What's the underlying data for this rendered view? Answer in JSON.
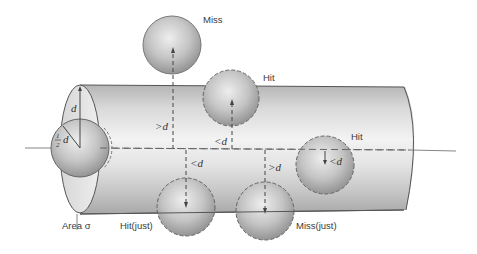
{
  "diagram": {
    "type": "collision-cross-section",
    "labels": {
      "miss": "Miss",
      "hit_top": "Hit",
      "hit_right": "Hit",
      "hit_just": "Hit(just)",
      "miss_just": "Miss(just)",
      "area": "Area σ",
      "d_vertical": "d",
      "half": "1",
      "half_den": "2",
      "half_d": "d",
      "gt_d_left": ">d",
      "lt_d_top": "<d",
      "lt_d_bottom": "<d",
      "gt_d_bottom": ">d",
      "lt_d_right": "<d"
    },
    "colors": {
      "cylinder_light": "#f4f4f4",
      "cylinder_dark": "#9a9a9a",
      "sphere_light": "#e8e8e8",
      "sphere_dark": "#8a8a8a",
      "outline": "#555555",
      "text": "#3a3a3a"
    }
  }
}
